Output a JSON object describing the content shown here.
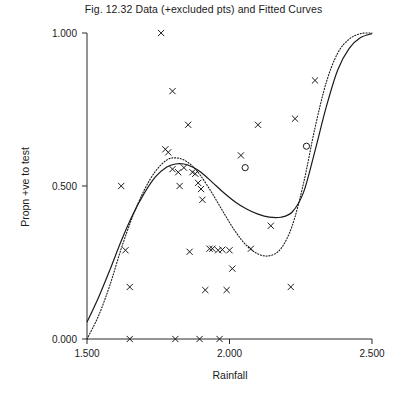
{
  "chart_data": {
    "type": "scatter",
    "title": "Fig. 12.32 Data (+excluded pts) and Fitted Curves",
    "xlabel": "Rainfall",
    "ylabel": "Propn +ve to test",
    "xlim": [
      1.5,
      2.5
    ],
    "ylim": [
      0.0,
      1.0
    ],
    "grid": false,
    "legend": "none",
    "xticks": [
      1.5,
      2.0,
      2.5
    ],
    "xtick_labels": [
      "1.500",
      "2.000",
      "2.500"
    ],
    "yticks": [
      0.0,
      0.5,
      1.0
    ],
    "ytick_labels": [
      "0.000",
      "0.500",
      "1.000"
    ],
    "series": [
      {
        "name": "included points",
        "marker": "x",
        "x": [
          1.62,
          1.635,
          1.65,
          1.76,
          1.775,
          1.785,
          1.8,
          1.8,
          1.82,
          1.825,
          1.84,
          1.855,
          1.86,
          1.87,
          1.88,
          1.89,
          1.9,
          1.905,
          1.915,
          1.93,
          1.94,
          1.96,
          1.975,
          1.99,
          2.0,
          2.01,
          2.04,
          2.075,
          2.1,
          2.145,
          2.215,
          2.23,
          2.3,
          1.65,
          1.81,
          1.895,
          1.965
        ],
        "y": [
          0.5,
          0.29,
          0.17,
          1.0,
          0.62,
          0.61,
          0.81,
          0.555,
          0.545,
          0.5,
          0.56,
          0.7,
          0.285,
          0.545,
          0.54,
          0.51,
          0.49,
          0.455,
          0.16,
          0.295,
          0.295,
          0.29,
          0.292,
          0.16,
          0.29,
          0.23,
          0.6,
          0.295,
          0.7,
          0.37,
          0.17,
          0.72,
          0.845,
          0.0,
          0.0,
          0.0,
          0.0
        ]
      },
      {
        "name": "excluded points",
        "marker": "o",
        "x": [
          2.055,
          2.27
        ],
        "y": [
          0.56,
          0.63
        ]
      }
    ],
    "curves": [
      {
        "name": "fitted curve (solid)",
        "style": "solid",
        "x": [
          1.5,
          1.54,
          1.58,
          1.62,
          1.66,
          1.7,
          1.74,
          1.78,
          1.81,
          1.84,
          1.87,
          1.9,
          1.94,
          1.98,
          2.02,
          2.06,
          2.1,
          2.14,
          2.18,
          2.22,
          2.26,
          2.3,
          2.34,
          2.38,
          2.42,
          2.46,
          2.5
        ],
        "y": [
          0.055,
          0.135,
          0.225,
          0.32,
          0.405,
          0.475,
          0.53,
          0.562,
          0.572,
          0.572,
          0.562,
          0.545,
          0.512,
          0.478,
          0.448,
          0.425,
          0.408,
          0.398,
          0.398,
          0.415,
          0.48,
          0.615,
          0.76,
          0.88,
          0.95,
          0.985,
          0.998
        ]
      },
      {
        "name": "fitted curve (dotted)",
        "style": "dotted",
        "x": [
          1.5,
          1.54,
          1.58,
          1.62,
          1.66,
          1.7,
          1.74,
          1.78,
          1.81,
          1.84,
          1.87,
          1.9,
          1.94,
          1.98,
          2.02,
          2.06,
          2.1,
          2.14,
          2.18,
          2.22,
          2.26,
          2.3,
          2.34,
          2.38,
          2.42,
          2.46,
          2.5
        ],
        "y": [
          0.0,
          0.075,
          0.175,
          0.295,
          0.4,
          0.485,
          0.548,
          0.585,
          0.592,
          0.585,
          0.565,
          0.532,
          0.475,
          0.412,
          0.352,
          0.305,
          0.278,
          0.272,
          0.295,
          0.37,
          0.51,
          0.69,
          0.84,
          0.935,
          0.98,
          0.998,
          1.0
        ]
      }
    ]
  }
}
